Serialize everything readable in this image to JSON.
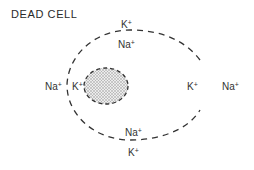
{
  "title": "DEAD CELL",
  "labels": {
    "top_outer": {
      "ion": "K",
      "charge": "+"
    },
    "top_inner": {
      "ion": "Na",
      "charge": "+"
    },
    "left_outer": {
      "ion": "Na",
      "charge": "+"
    },
    "left_inner": {
      "ion": "K",
      "charge": "+"
    },
    "right_inner": {
      "ion": "K",
      "charge": "+"
    },
    "right_outer": {
      "ion": "Na",
      "charge": "+"
    },
    "bottom_inner": {
      "ion": "Na",
      "charge": "+"
    },
    "bottom_outer": {
      "ion": "K",
      "charge": "+"
    }
  },
  "components": {
    "membrane": "dashed-cell-membrane",
    "nucleus": "stippled-nucleus"
  },
  "colors": {
    "line": "#333333",
    "stipple": "#888888"
  }
}
